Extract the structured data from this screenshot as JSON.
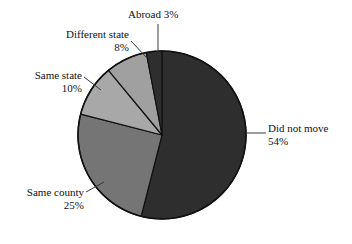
{
  "chart_data": {
    "type": "pie",
    "title": "",
    "subtitle": "",
    "xlabel": "",
    "ylabel": "",
    "legend_position": "none",
    "grid": false,
    "labels_outside": true,
    "start_angle_deg": 0,
    "direction": "clockwise",
    "categories": [
      "Did not move",
      "Same county",
      "Same state",
      "Different state",
      "Abroad"
    ],
    "values": [
      54,
      25,
      10,
      8,
      3
    ],
    "value_unit": "%",
    "colors": [
      "#2e2e2e",
      "#757575",
      "#a8a8a8",
      "#a0a0a0",
      "#2e2e2e"
    ],
    "slices": [
      {
        "name": "Did not move",
        "value": 54,
        "value_text": "54%",
        "color": "#2e2e2e"
      },
      {
        "name": "Same county",
        "value": 25,
        "value_text": "25%",
        "color": "#757575"
      },
      {
        "name": "Same state",
        "value": 10,
        "value_text": "10%",
        "color": "#a8a8a8"
      },
      {
        "name": "Different state",
        "value": 8,
        "value_text": "8%",
        "color": "#a0a0a0"
      },
      {
        "name": "Abroad",
        "value": 3,
        "value_text": "3%",
        "color": "#2e2e2e"
      }
    ]
  },
  "labels": {
    "did_not_move": {
      "line1": "Did not move",
      "line2": "54%"
    },
    "same_county": {
      "line1": "Same county",
      "line2": "25%"
    },
    "same_state": {
      "line1": "Same state",
      "line2": "10%"
    },
    "different_state": {
      "line1": "Different state",
      "line2": "8%"
    },
    "abroad": {
      "line1": "Abroad 3%",
      "line2": ""
    }
  },
  "style": {
    "background": "#ffffff",
    "outline_color": "#111111",
    "leader_color": "#3a3a3a",
    "text_color": "#121212"
  }
}
